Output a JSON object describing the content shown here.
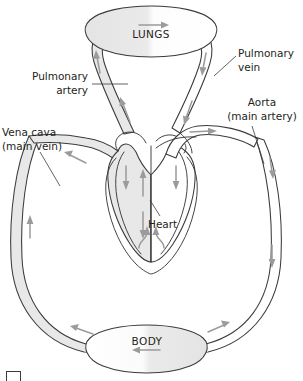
{
  "figure": {
    "organs": {
      "lungs": "LUNGS",
      "body": "BODY",
      "heart": "Heart"
    },
    "vessel_labels": {
      "pulmonary_artery": "Pulmonary\nartery",
      "pulmonary_artery_line1": "Pulmonary",
      "pulmonary_artery_line2": "artery",
      "pulmonary_vein_line1": "Pulmonary",
      "pulmonary_vein_line2": "vein",
      "vena_cava_line1": "Vena cava",
      "vena_cava_line2": "(main vein)",
      "aorta_line1": "Aorta",
      "aorta_line2": "(main artery)"
    },
    "legend": {
      "swatch_label": "",
      "caption": ""
    },
    "colors": {
      "deoxygenated_fill": "#e8e8e8",
      "oxygenated_fill": "#ffffff",
      "outline": "#3b3b3b",
      "arrow": "#9b9b9b",
      "background": "#ffffff",
      "text": "#231f20"
    },
    "flow": {
      "lungs_direction": "right",
      "body_direction": "left",
      "vena_cava_direction": "up",
      "aorta_direction": "down",
      "pulmonary_artery_direction": "up",
      "pulmonary_vein_direction": "down"
    }
  }
}
